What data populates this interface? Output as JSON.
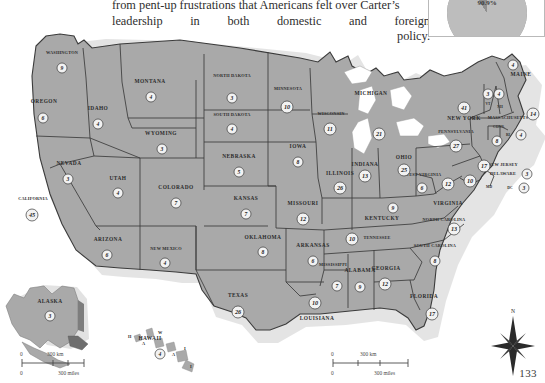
{
  "page": {
    "number": "133",
    "body_text": {
      "line1": "from pent-up frustrations that Americans felt over Carter’s",
      "line2_words": [
        "leadership",
        "in",
        "both",
        "domestic",
        "and",
        "foreign"
      ],
      "line3": "policy."
    }
  },
  "pie_inset": {
    "name": "pie-chart-inset",
    "label": "90.9%"
  },
  "chart_data": {
    "type": "map",
    "value_label": "Electoral votes",
    "states": [
      {
        "code": "WA",
        "name": "WASHINGTON",
        "votes": 9,
        "x": 62,
        "y": 50,
        "lx": 62,
        "ly": 36
      },
      {
        "code": "OR",
        "name": "OREGON",
        "votes": 6,
        "x": 43,
        "y": 100,
        "lx": 44,
        "ly": 85
      },
      {
        "code": "CA",
        "name": "CALIFORNIA",
        "votes": 45,
        "x": 32,
        "y": 197,
        "lx": 33,
        "ly": 182
      },
      {
        "code": "NV",
        "name": "NEVADA",
        "votes": 3,
        "x": 68,
        "y": 161,
        "lx": 69,
        "ly": 147
      },
      {
        "code": "ID",
        "name": "IDAHO",
        "votes": 4,
        "x": 98,
        "y": 106,
        "lx": 98,
        "ly": 92
      },
      {
        "code": "MT",
        "name": "MONTANA",
        "votes": 4,
        "x": 151,
        "y": 79,
        "lx": 150,
        "ly": 65
      },
      {
        "code": "WY",
        "name": "WYOMING",
        "votes": 3,
        "x": 162,
        "y": 131,
        "lx": 161,
        "ly": 117
      },
      {
        "code": "UT",
        "name": "UTAH",
        "votes": 4,
        "x": 118,
        "y": 175,
        "lx": 118,
        "ly": 162
      },
      {
        "code": "AZ",
        "name": "ARIZONA",
        "votes": 6,
        "x": 107,
        "y": 237,
        "lx": 108,
        "ly": 223
      },
      {
        "code": "CO",
        "name": "COLORADO",
        "votes": 7,
        "x": 176,
        "y": 185,
        "lx": 176,
        "ly": 171
      },
      {
        "code": "NM",
        "name": "NEW MEXICO",
        "votes": 4,
        "x": 165,
        "y": 245,
        "lx": 166,
        "ly": 232
      },
      {
        "code": "ND",
        "name": "NORTH DAKOTA",
        "votes": 3,
        "x": 232,
        "y": 80,
        "lx": 232,
        "ly": 59
      },
      {
        "code": "SD",
        "name": "SOUTH DAKOTA",
        "votes": 4,
        "x": 232,
        "y": 111,
        "lx": 232,
        "ly": 98
      },
      {
        "code": "NE",
        "name": "NEBRASKA",
        "votes": 5,
        "x": 239,
        "y": 154,
        "lx": 239,
        "ly": 140
      },
      {
        "code": "KS",
        "name": "KANSAS",
        "votes": 7,
        "x": 246,
        "y": 196,
        "lx": 246,
        "ly": 182
      },
      {
        "code": "OK",
        "name": "OKLAHOMA",
        "votes": 8,
        "x": 263,
        "y": 234,
        "lx": 263,
        "ly": 221
      },
      {
        "code": "TX",
        "name": "TEXAS",
        "votes": 26,
        "x": 238,
        "y": 294,
        "lx": 238,
        "ly": 279
      },
      {
        "code": "MN",
        "name": "MINNESOTA",
        "votes": 10,
        "x": 287,
        "y": 89,
        "lx": 288,
        "ly": 72
      },
      {
        "code": "IA",
        "name": "IOWA",
        "votes": 8,
        "x": 298,
        "y": 144,
        "lx": 298,
        "ly": 130
      },
      {
        "code": "MO",
        "name": "MISSOURI",
        "votes": 12,
        "x": 303,
        "y": 201,
        "lx": 303,
        "ly": 187
      },
      {
        "code": "AR",
        "name": "ARKANSAS",
        "votes": 6,
        "x": 313,
        "y": 243,
        "lx": 313,
        "ly": 229
      },
      {
        "code": "LA",
        "name": "LOUISIANA",
        "votes": 10,
        "x": 315,
        "y": 285,
        "lx": 317,
        "ly": 302
      },
      {
        "code": "WI",
        "name": "WISCONSIN",
        "votes": 11,
        "x": 330,
        "y": 111,
        "lx": 331,
        "ly": 97
      },
      {
        "code": "IL",
        "name": "ILLINOIS",
        "votes": 26,
        "x": 340,
        "y": 170,
        "lx": 340,
        "ly": 157
      },
      {
        "code": "MS",
        "name": "MISSISSIPPI",
        "votes": 7,
        "x": 337,
        "y": 268,
        "lx": 333,
        "ly": 248
      },
      {
        "code": "MI",
        "name": "MICHIGAN",
        "votes": 21,
        "x": 379,
        "y": 116,
        "lx": 371,
        "ly": 77
      },
      {
        "code": "IN",
        "name": "INDIANA",
        "votes": 13,
        "x": 365,
        "y": 158,
        "lx": 365,
        "ly": 148
      },
      {
        "code": "TN",
        "name": "TENNESSEE",
        "votes": 10,
        "x": 352,
        "y": 221,
        "lx": 377,
        "ly": 221
      },
      {
        "code": "AL",
        "name": "ALABAMA",
        "votes": 9,
        "x": 360,
        "y": 269,
        "lx": 360,
        "ly": 254
      },
      {
        "code": "GA",
        "name": "GEORGIA",
        "votes": 12,
        "x": 385,
        "y": 266,
        "lx": 386,
        "ly": 252
      },
      {
        "code": "OH",
        "name": "OHIO",
        "votes": 25,
        "x": 404,
        "y": 152,
        "lx": 404,
        "ly": 141
      },
      {
        "code": "KY",
        "name": "KENTUCKY",
        "votes": 9,
        "x": 393,
        "y": 190,
        "lx": 382,
        "ly": 202
      },
      {
        "code": "WV",
        "name": "WEST VIRGINIA",
        "votes": 6,
        "x": 422,
        "y": 170,
        "lx": 423,
        "ly": 158
      },
      {
        "code": "VA",
        "name": "VIRGINIA",
        "votes": 12,
        "x": 448,
        "y": 166,
        "lx": 448,
        "ly": 187
      },
      {
        "code": "NC",
        "name": "NORTH CAROLINA",
        "votes": 13,
        "x": 454,
        "y": 211,
        "lx": 444,
        "ly": 203
      },
      {
        "code": "SC",
        "name": "SOUTH CAROLINA",
        "votes": 8,
        "x": 435,
        "y": 243,
        "lx": 435,
        "ly": 229
      },
      {
        "code": "FL",
        "name": "FLORIDA",
        "votes": 17,
        "x": 432,
        "y": 296,
        "lx": 424,
        "ly": 280
      },
      {
        "code": "PA",
        "name": "PENNSYLVANIA",
        "votes": 27,
        "x": 456,
        "y": 128,
        "lx": 456,
        "ly": 115
      },
      {
        "code": "NY",
        "name": "NEW YORK",
        "votes": 41,
        "x": 464,
        "y": 90,
        "lx": 464,
        "ly": 102
      },
      {
        "code": "ME",
        "name": "MAINE",
        "votes": 4,
        "x": 513,
        "y": 47,
        "lx": 521,
        "ly": 58
      },
      {
        "code": "VT",
        "name": "VT",
        "votes": 3,
        "x": 488,
        "y": 76,
        "lx": 488,
        "ly": 87
      },
      {
        "code": "NH",
        "name": "NH",
        "votes": 4,
        "x": 499,
        "y": 76,
        "lx": 500,
        "ly": 90
      },
      {
        "code": "MA",
        "name": "MASSACHUSETTS",
        "votes": 14,
        "x": 533,
        "y": 96,
        "lx": 508,
        "ly": 101
      },
      {
        "code": "CT",
        "name": "CONN.",
        "votes": 8,
        "x": 497,
        "y": 123,
        "lx": 499,
        "ly": 110
      },
      {
        "code": "RI",
        "name": "RI",
        "votes": 4,
        "x": 521,
        "y": 117,
        "lx": 508,
        "ly": 118
      },
      {
        "code": "NJ",
        "name": "NEW JERSEY",
        "votes": 17,
        "x": 484,
        "y": 148,
        "lx": 503,
        "ly": 148
      },
      {
        "code": "DE",
        "name": "DELAWARE",
        "votes": 3,
        "x": 527,
        "y": 156,
        "lx": 503,
        "ly": 157
      },
      {
        "code": "MD",
        "name": "MD",
        "votes": 10,
        "x": 470,
        "y": 163,
        "lx": 489,
        "ly": 170
      },
      {
        "code": "DC",
        "name": "DC",
        "votes": 3,
        "x": 524,
        "y": 170,
        "lx": 510,
        "ly": 171
      },
      {
        "code": "AK",
        "name": "ALASKA",
        "votes": 3,
        "x": 50,
        "y": 298,
        "lx": 50,
        "ly": 285
      },
      {
        "code": "HI",
        "name": "HAWAII",
        "votes": 4,
        "x": 160,
        "y": 336,
        "lx": 150,
        "ly": 322
      }
    ]
  },
  "scalebars": {
    "main": {
      "km_zero": "0",
      "km_label": "300 km",
      "miles_zero": "0",
      "miles_label": "300 miles"
    },
    "alaska": {
      "km_zero": "0",
      "km_label": "300 km",
      "miles_zero": "0",
      "miles_label": "300 miles"
    }
  },
  "compass": {
    "north_label": "N"
  },
  "hawaii_islands": [
    "H",
    "A",
    "W",
    "A",
    "I",
    "I"
  ],
  "colors": {
    "land": "#a9a9a9",
    "land_stroke": "#3b3b3b",
    "water": "#ffffff",
    "shadow": "#cfcfcf",
    "bubble_fill": "#f2f2f2",
    "text": "#2b2b2b"
  }
}
